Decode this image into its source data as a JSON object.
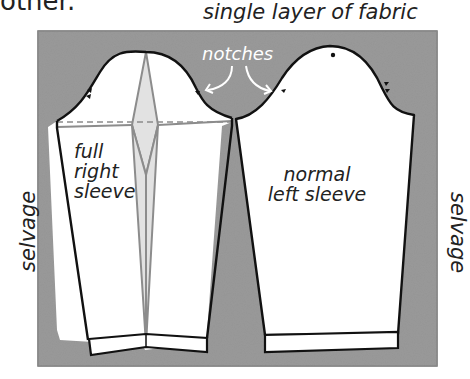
{
  "header": {
    "fragment_text": "other.",
    "title": "single layer of fabric"
  },
  "labels": {
    "notches": "notches",
    "left_piece": [
      "full",
      "right",
      "sleeve"
    ],
    "right_piece": [
      "normal",
      "left sleeve"
    ],
    "selvage_left": "selvage",
    "selvage_right": "selvage"
  },
  "colors": {
    "fabric": "#9a9a9a",
    "pattern_fill": "#ffffff",
    "outline": "#111111",
    "slash_line": "#8c8c8c",
    "spread_fill": "#e4e4e4",
    "annotation_text": "#ffffff"
  }
}
